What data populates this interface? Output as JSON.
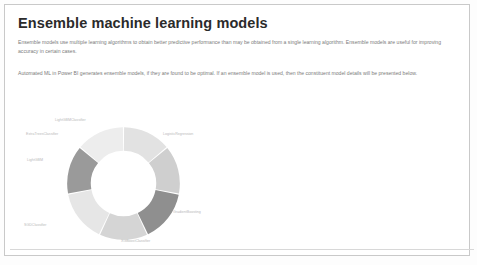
{
  "panel": {
    "title": "Ensemble machine learning models",
    "paragraphs": [
      "Ensemble models use multiple learning algorithms to obtain better predictive performance than may be obtained from a single learning algorithm. Ensemble models are useful for improving accuracy in certain cases.",
      "Automated ML in Power BI generates ensemble models, if they are found to be optimal. If an ensemble model is used, then the constituent model details will be presented below."
    ]
  },
  "chart_data": {
    "type": "pie",
    "title": "",
    "subtype": "donut",
    "legend_position": "around-slices",
    "grid": false,
    "hole_ratio": 0.58,
    "start_angle": -90,
    "categories": [
      "LightGBMClassifier",
      "LogisticRegression",
      "GradientBoosting",
      "XGBoostClassifier",
      "SGDClassifier",
      "LightGBM",
      "ExtraTreesClassifier"
    ],
    "values": [
      14,
      14,
      15,
      14,
      15,
      14,
      14
    ],
    "colors": [
      "#e2e2e2",
      "#cfcfcf",
      "#8f8f8f",
      "#d5d5d5",
      "#e6e6e6",
      "#9a9a9a",
      "#ededed"
    ],
    "labels": [
      {
        "text": "LightGBMClassifier",
        "left": 44,
        "top": 10
      },
      {
        "text": "LogisticRegression",
        "left": 152,
        "top": 24
      },
      {
        "text": "GradientBoosting",
        "left": 162,
        "top": 102
      },
      {
        "text": "XGBoostClassifier",
        "left": 110,
        "top": 131
      },
      {
        "text": "SGDClassifier",
        "left": 13,
        "top": 115
      },
      {
        "text": "LightGBM",
        "left": 16,
        "top": 50
      },
      {
        "text": "ExtraTreesClassifier",
        "left": 15,
        "top": 24
      }
    ],
    "xlabel": "",
    "ylabel": ""
  },
  "colors": {
    "card_border": "#c9c9c9",
    "title": "#2b2b2b",
    "body_text": "#7b7b7b",
    "label_text": "#b9b9b9"
  }
}
